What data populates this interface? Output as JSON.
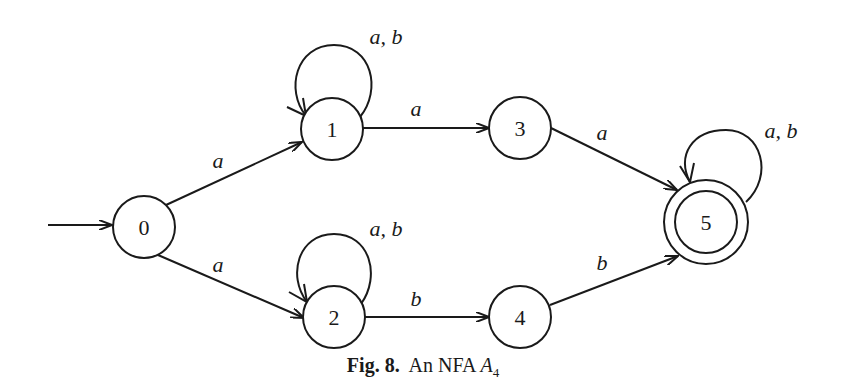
{
  "diagram": {
    "type": "NFA",
    "nodes": [
      {
        "id": "0",
        "label": "0",
        "x": 144,
        "y": 227,
        "accepting": false,
        "initial": true
      },
      {
        "id": "1",
        "label": "1",
        "x": 332,
        "y": 129,
        "accepting": false
      },
      {
        "id": "2",
        "label": "2",
        "x": 334,
        "y": 317,
        "accepting": false
      },
      {
        "id": "3",
        "label": "3",
        "x": 520,
        "y": 128,
        "accepting": false
      },
      {
        "id": "4",
        "label": "4",
        "x": 520,
        "y": 317,
        "accepting": false
      },
      {
        "id": "5",
        "label": "5",
        "x": 706,
        "y": 222,
        "accepting": true
      }
    ],
    "edges": [
      {
        "from": "0",
        "to": "1",
        "label": "a"
      },
      {
        "from": "0",
        "to": "2",
        "label": "a"
      },
      {
        "from": "1",
        "to": "1",
        "label": "a, b"
      },
      {
        "from": "2",
        "to": "2",
        "label": "a, b"
      },
      {
        "from": "1",
        "to": "3",
        "label": "a"
      },
      {
        "from": "2",
        "to": "4",
        "label": "b"
      },
      {
        "from": "3",
        "to": "5",
        "label": "a"
      },
      {
        "from": "4",
        "to": "5",
        "label": "b"
      },
      {
        "from": "5",
        "to": "5",
        "label": "a, b"
      }
    ]
  },
  "caption": {
    "fig": "Fig. 8.",
    "text": "An NFA",
    "symbol": "A",
    "subscript": "4"
  }
}
